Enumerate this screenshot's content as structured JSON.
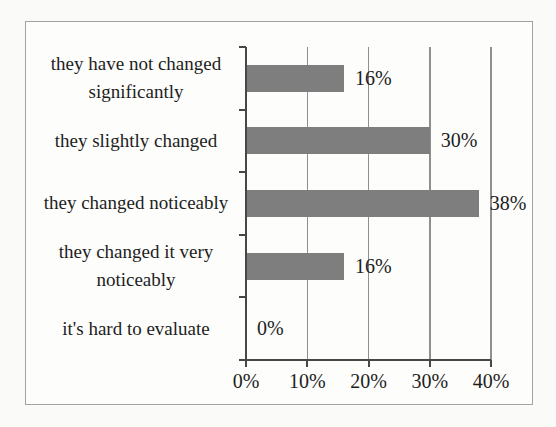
{
  "figure": {
    "kind": "scanned-survey-bar-chart",
    "background": "#fdfdfc",
    "border_color": "#a3a3a1"
  },
  "chart_data": {
    "type": "bar",
    "orientation": "horizontal",
    "title": "",
    "xlabel": "",
    "ylabel": "",
    "categories": [
      "they have not changed significantly",
      "they slightly changed",
      "they changed noticeably",
      "they changed it very noticeably",
      "it's hard to evaluate"
    ],
    "values": [
      16,
      30,
      38,
      16,
      0
    ],
    "value_labels": [
      "16%",
      "30%",
      "38%",
      "16%",
      "0%"
    ],
    "xlim": [
      0,
      40
    ],
    "x_ticks": [
      0,
      10,
      20,
      30,
      40
    ],
    "x_tick_labels": [
      "0%",
      "10%",
      "20%",
      "30%",
      "40%"
    ],
    "grid": true,
    "legend": false,
    "bar_color": "#7e7e7e",
    "gridline_color": "#8f8f8f",
    "axis_color": "#474745",
    "text_color": "#1e1e1c"
  }
}
